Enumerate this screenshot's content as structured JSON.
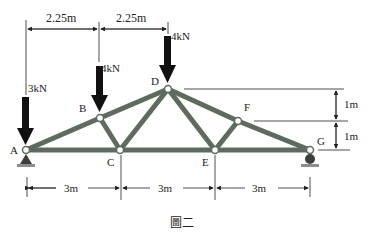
{
  "figure": {
    "caption": "圖二",
    "colors": {
      "member": "#5f6b5f",
      "line": "#222222",
      "arrow": "#111111",
      "joint_fill": "#ffffff"
    }
  },
  "joints": {
    "A": {
      "label": "A"
    },
    "B": {
      "label": "B"
    },
    "C": {
      "label": "C"
    },
    "D": {
      "label": "D"
    },
    "E": {
      "label": "E"
    },
    "F": {
      "label": "F"
    },
    "G": {
      "label": "G"
    }
  },
  "loads": [
    {
      "joint": "A",
      "label": "3kN"
    },
    {
      "joint": "B",
      "label": "4kN"
    },
    {
      "joint": "D",
      "label": "4kN"
    }
  ],
  "dimensions": {
    "top": [
      "2.25m",
      "2.25m"
    ],
    "right": [
      "1m",
      "1m"
    ],
    "bottom": [
      "3m",
      "3m",
      "3m"
    ]
  }
}
